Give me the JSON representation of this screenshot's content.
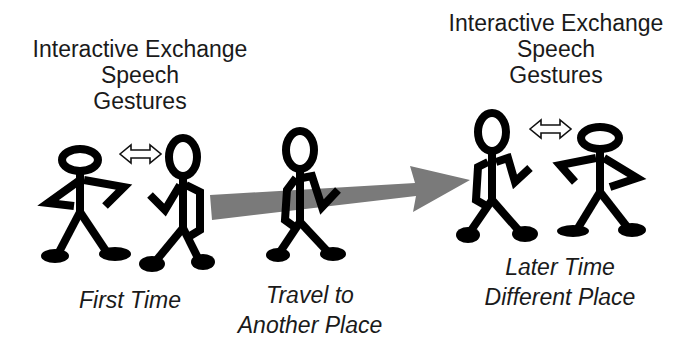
{
  "left_group": {
    "heading": [
      "Interactive Exchange",
      "Speech",
      "Gestures"
    ],
    "caption": "First Time"
  },
  "middle_group": {
    "caption": [
      "Travel to",
      "Another Place"
    ]
  },
  "right_group": {
    "heading": [
      "Interactive Exchange",
      "Speech",
      "Gestures"
    ],
    "caption": [
      "Later Time",
      "Different Place"
    ]
  },
  "colors": {
    "figure": "#000000",
    "arrow": "#7a7a7a",
    "text": "#1a1a1a"
  },
  "icons": {
    "exchange_arrow": "double-headed-arrow-icon",
    "travel_arrow": "travel-arrow-icon",
    "person": "stick-figure-icon"
  }
}
